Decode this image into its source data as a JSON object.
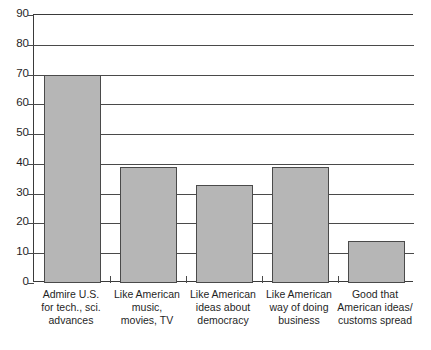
{
  "chart_data": {
    "type": "bar",
    "title": "",
    "subtitle": "",
    "xlabel": "",
    "ylabel": "",
    "ylim": [
      0,
      90
    ],
    "ytick_step": 10,
    "yticks": [
      0,
      10,
      20,
      30,
      40,
      50,
      60,
      70,
      80,
      90
    ],
    "ytick_labels": [
      "0",
      "10",
      "20",
      "30",
      "40",
      "50",
      "60",
      "70",
      "80",
      "90"
    ],
    "grid": true,
    "grid_axis": "y",
    "legend": false,
    "legend_position": "none",
    "bar_color": "#b6b6b6",
    "bar_edge_color": "#4a4a4a",
    "axis_color": "#3a3a3a",
    "background_color": "#ffffff",
    "categories": [
      "Admire U.S. for tech., sci. advances",
      "Like American music, movies, TV",
      "Like American ideas about democracy",
      "Like American way of doing business",
      "Good that American ideas/customs spread"
    ],
    "category_lines": [
      [
        "Admire U.S.",
        "for tech., sci.",
        "advances"
      ],
      [
        "Like American",
        "music,",
        "movies, TV"
      ],
      [
        "Like American",
        "ideas about",
        "democracy"
      ],
      [
        "Like American",
        "way of doing",
        "business"
      ],
      [
        "Good that",
        "American ideas/",
        "customs spread"
      ]
    ],
    "values": [
      70,
      39,
      33,
      39,
      14
    ]
  }
}
